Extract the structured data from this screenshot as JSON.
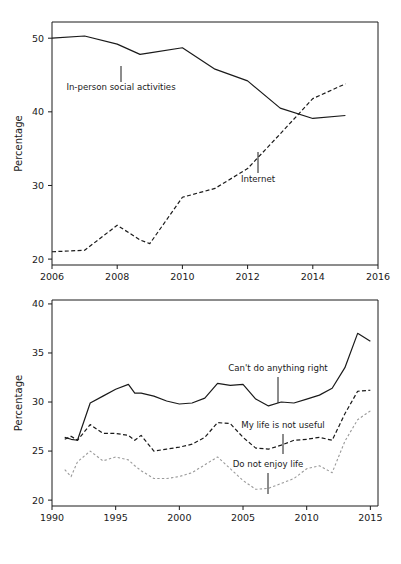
{
  "figure": {
    "background": "#ffffff",
    "text_color": "#1a1a1a"
  },
  "chart_data": [
    {
      "id": "top",
      "type": "line",
      "title": "",
      "xlabel": "",
      "ylabel": "Percentage",
      "xlim": [
        2006,
        2016
      ],
      "ylim": [
        19.2,
        52.2
      ],
      "xticks": [
        2006,
        2008,
        2010,
        2012,
        2014,
        2016
      ],
      "xtick_labels": [
        "2006",
        "2008",
        "2010",
        "2012",
        "2014",
        "2016"
      ],
      "yticks": [
        20,
        30,
        40,
        50
      ],
      "ytick_labels": [
        "20",
        "30",
        "40",
        "50"
      ],
      "grid": false,
      "legend": "inline-annotations",
      "series": [
        {
          "name": "In-person social activities",
          "style": "solid",
          "color": "#1a1a1a",
          "width": 1.2,
          "x": [
            2006,
            2007,
            2008,
            2008.7,
            2009,
            2010,
            2011,
            2012,
            2013,
            2014,
            2015
          ],
          "values": [
            50.0,
            50.3,
            49.2,
            47.8,
            48.0,
            48.7,
            45.8,
            44.2,
            40.5,
            39.1,
            39.5
          ]
        },
        {
          "name": "Internet",
          "style": "dashed",
          "color": "#1a1a1a",
          "width": 1.2,
          "x": [
            2006,
            2007,
            2008,
            2008.7,
            2009,
            2010,
            2011,
            2012,
            2013,
            2014,
            2015
          ],
          "values": [
            21.0,
            21.2,
            24.6,
            22.6,
            22.1,
            28.4,
            29.6,
            32.3,
            37.0,
            41.8,
            43.8
          ]
        }
      ],
      "annotations": [
        {
          "text": "In-person social activities",
          "label_x": 121,
          "label_y": 90,
          "leader_x": 121,
          "leader_y1": 66,
          "leader_y2": 82
        },
        {
          "text": "Internet",
          "label_x": 258,
          "label_y": 182,
          "leader_x": 258,
          "leader_y1": 152,
          "leader_y2": 173
        }
      ]
    },
    {
      "id": "bottom",
      "type": "line",
      "title": "",
      "xlabel": "",
      "ylabel": "Percentage",
      "xlim": [
        1990,
        2015.6
      ],
      "ylim": [
        19.4,
        40.4
      ],
      "xticks": [
        1990,
        1995,
        2000,
        2005,
        2010,
        2015
      ],
      "xtick_labels": [
        "1990",
        "1995",
        "2000",
        "2005",
        "2010",
        "2015"
      ],
      "yticks": [
        20,
        25,
        30,
        35,
        40
      ],
      "ytick_labels": [
        "20",
        "25",
        "30",
        "35",
        "40"
      ],
      "grid": false,
      "legend": "inline-annotations",
      "series": [
        {
          "name": "Can't do anything right",
          "style": "solid",
          "color": "#1a1a1a",
          "width": 1.2,
          "x": [
            1991,
            1991.5,
            1992,
            1993,
            1994,
            1995,
            1996,
            1996.5,
            1997,
            1998,
            1999,
            2000,
            2001,
            2002,
            2003,
            2004,
            2005,
            2006,
            2007,
            2008,
            2009,
            2010,
            2011,
            2012,
            2013,
            2014,
            2015
          ],
          "values": [
            26.4,
            26.2,
            26.1,
            29.9,
            30.6,
            31.3,
            31.8,
            30.9,
            30.9,
            30.6,
            30.1,
            29.8,
            29.9,
            30.4,
            31.9,
            31.7,
            31.8,
            30.3,
            29.6,
            30.0,
            29.9,
            30.3,
            30.7,
            31.4,
            33.5,
            37.0,
            36.2
          ]
        },
        {
          "name": "My life is not useful",
          "style": "dashed",
          "color": "#1a1a1a",
          "width": 1.2,
          "x": [
            1991,
            1991.5,
            1992,
            1993,
            1994,
            1995,
            1996,
            1996.5,
            1997,
            1998,
            1999,
            2000,
            2001,
            2002,
            2003,
            2004,
            2005,
            2006,
            2007,
            2008,
            2009,
            2010,
            2011,
            2012,
            2013,
            2014,
            2015
          ],
          "values": [
            26.2,
            26.5,
            26.1,
            27.7,
            26.8,
            26.8,
            26.6,
            26.1,
            26.6,
            25.0,
            25.2,
            25.4,
            25.7,
            26.4,
            27.9,
            27.8,
            26.4,
            25.3,
            25.2,
            25.6,
            26.1,
            26.2,
            26.4,
            26.1,
            28.8,
            31.1,
            31.2
          ]
        },
        {
          "name": "Do not enjoy life",
          "style": "dotted",
          "color": "#9a9a9a",
          "width": 1.1,
          "x": [
            1991,
            1991.5,
            1992,
            1993,
            1994,
            1995,
            1996,
            1996.5,
            1997,
            1998,
            1999,
            2000,
            2001,
            2002,
            2003,
            2004,
            2005,
            2006,
            2007,
            2008,
            2009,
            2010,
            2011,
            2012,
            2013,
            2014,
            2015
          ],
          "values": [
            23.1,
            22.4,
            23.9,
            25.0,
            24.0,
            24.4,
            24.1,
            23.5,
            23.0,
            22.2,
            22.2,
            22.4,
            22.8,
            23.6,
            24.4,
            23.2,
            22.0,
            21.1,
            21.2,
            21.7,
            22.2,
            23.2,
            23.5,
            22.8,
            26.0,
            28.2,
            29.1
          ]
        }
      ],
      "annotations": [
        {
          "text": "Can't do anything right",
          "label_x": 278,
          "label_y": 371,
          "leader_x": 278,
          "leader_y1": 377,
          "leader_y2": 403
        },
        {
          "text": "My life is not useful",
          "label_x": 283,
          "label_y": 428,
          "leader_x": 283,
          "leader_y1": 434,
          "leader_y2": 454
        },
        {
          "text": "Do not enjoy life",
          "label_x": 268,
          "label_y": 467,
          "leader_x": 268,
          "leader_y1": 473,
          "leader_y2": 494
        }
      ]
    }
  ]
}
